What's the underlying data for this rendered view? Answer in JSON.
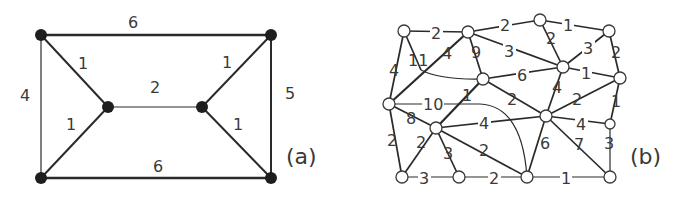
{
  "graph_a": {
    "caption": "(a)",
    "nodes": [
      {
        "id": "TL",
        "x": 41,
        "y": 35
      },
      {
        "id": "TR",
        "x": 271,
        "y": 35
      },
      {
        "id": "BL",
        "x": 41,
        "y": 178
      },
      {
        "id": "BR",
        "x": 271,
        "y": 178
      },
      {
        "id": "ML",
        "x": 108,
        "y": 107
      },
      {
        "id": "MR",
        "x": 202,
        "y": 107
      }
    ],
    "edges": [
      {
        "from": "TL",
        "to": "TR",
        "weight": "6",
        "lx": 133,
        "ly": 23
      },
      {
        "from": "BL",
        "to": "BR",
        "weight": "6",
        "lx": 158,
        "ly": 170
      },
      {
        "from": "TL",
        "to": "BL",
        "weight": "4",
        "lx": 26,
        "ly": 100
      },
      {
        "from": "TR",
        "to": "BR",
        "weight": "5",
        "lx": 291,
        "ly": 97
      },
      {
        "from": "TL",
        "to": "ML",
        "weight": "1",
        "lx": 83,
        "ly": 68
      },
      {
        "from": "BL",
        "to": "ML",
        "weight": "1",
        "lx": 71,
        "ly": 128
      },
      {
        "from": "ML",
        "to": "MR",
        "weight": "2",
        "lx": 155,
        "ly": 92
      },
      {
        "from": "TR",
        "to": "MR",
        "weight": "1",
        "lx": 226,
        "ly": 67
      },
      {
        "from": "BR",
        "to": "MR",
        "weight": "1",
        "lx": 237,
        "ly": 128
      }
    ]
  },
  "graph_b": {
    "caption": "(b)",
    "nodes": [
      {
        "id": "n1",
        "x": 404,
        "y": 31
      },
      {
        "id": "n2",
        "x": 468,
        "y": 32
      },
      {
        "id": "n3",
        "x": 540,
        "y": 20
      },
      {
        "id": "n4",
        "x": 609,
        "y": 31
      },
      {
        "id": "n5",
        "x": 483,
        "y": 79
      },
      {
        "id": "n6",
        "x": 563,
        "y": 67
      },
      {
        "id": "n7",
        "x": 620,
        "y": 78
      },
      {
        "id": "n8",
        "x": 389,
        "y": 104
      },
      {
        "id": "n9",
        "x": 436,
        "y": 128
      },
      {
        "id": "n10",
        "x": 546,
        "y": 116
      },
      {
        "id": "n11",
        "x": 610,
        "y": 124
      },
      {
        "id": "n12",
        "x": 402,
        "y": 177
      },
      {
        "id": "n13",
        "x": 459,
        "y": 177
      },
      {
        "id": "n14",
        "x": 527,
        "y": 177
      },
      {
        "id": "n15",
        "x": 610,
        "y": 177
      }
    ],
    "edges": [
      {
        "from": "n1",
        "to": "n2",
        "weight": "2",
        "lx": 436,
        "ly": 38
      },
      {
        "from": "n2",
        "to": "n3",
        "weight": "2",
        "lx": 505,
        "ly": 30
      },
      {
        "from": "n3",
        "to": "n4",
        "weight": "1",
        "lx": 568,
        "ly": 30
      },
      {
        "from": "n2",
        "to": "n6",
        "weight": "3",
        "lx": 509,
        "ly": 56
      },
      {
        "from": "n3",
        "to": "n6",
        "weight": "2",
        "lx": 551,
        "ly": 43
      },
      {
        "from": "n4",
        "to": "n6",
        "weight": "3",
        "lx": 588,
        "ly": 53
      },
      {
        "from": "n4",
        "to": "n7",
        "weight": "2",
        "lx": 616,
        "ly": 57
      },
      {
        "from": "n6",
        "to": "n7",
        "weight": "1",
        "lx": 586,
        "ly": 78
      },
      {
        "from": "n5",
        "to": "n6",
        "weight": "6",
        "lx": 522,
        "ly": 80
      },
      {
        "from": "n2",
        "to": "n5",
        "weight": "9",
        "lx": 476,
        "ly": 57
      },
      {
        "from": "n1",
        "to": "n8",
        "weight": "4",
        "lx": 394,
        "ly": 75
      },
      {
        "from": "n1",
        "to": "crossing",
        "weight": "11",
        "lx": 414,
        "ly": 65
      },
      {
        "from": "n8",
        "to": "n2",
        "weight": "4",
        "lx": 447,
        "ly": 58
      },
      {
        "from": "n5",
        "to": "n9",
        "weight": "1",
        "lx": 467,
        "ly": 100
      },
      {
        "from": "n5",
        "to": "n10",
        "weight": "2",
        "lx": 512,
        "ly": 104
      },
      {
        "from": "n6",
        "to": "n10",
        "weight": "4",
        "lx": 557,
        "ly": 92
      },
      {
        "from": "n7",
        "to": "n10",
        "weight": "2",
        "lx": 577,
        "ly": 104
      },
      {
        "from": "n7",
        "to": "n11",
        "weight": "1",
        "lx": 616,
        "ly": 106
      },
      {
        "from": "n8",
        "to": "n9",
        "weight": "8",
        "lx": 411,
        "ly": 123
      },
      {
        "from": "n8",
        "to": "n14",
        "weight": "10",
        "lx": 428,
        "ly": 109
      },
      {
        "from": "n9",
        "to": "n10",
        "weight": "4",
        "lx": 484,
        "ly": 128
      },
      {
        "from": "n10",
        "to": "n11",
        "weight": "4",
        "lx": 581,
        "ly": 129
      },
      {
        "from": "n8",
        "to": "n12",
        "weight": "2",
        "lx": 392,
        "ly": 145
      },
      {
        "from": "n9",
        "to": "n12",
        "weight": "2",
        "lx": 421,
        "ly": 147
      },
      {
        "from": "n9",
        "to": "n13",
        "weight": "3",
        "lx": 448,
        "ly": 158
      },
      {
        "from": "n9",
        "to": "n14",
        "weight": "2",
        "lx": 484,
        "ly": 155
      },
      {
        "from": "n10",
        "to": "n14",
        "weight": "6",
        "lx": 545,
        "ly": 148
      },
      {
        "from": "n10",
        "to": "n15",
        "weight": "7",
        "lx": 579,
        "ly": 149
      },
      {
        "from": "n11",
        "to": "n15",
        "weight": "3",
        "lx": 609,
        "ly": 148
      },
      {
        "from": "n12",
        "to": "n13",
        "weight": "3",
        "lx": 424,
        "ly": 183
      },
      {
        "from": "n13",
        "to": "n14",
        "weight": "2",
        "lx": 494,
        "ly": 183
      },
      {
        "from": "n14",
        "to": "n15",
        "weight": "1",
        "lx": 566,
        "ly": 183
      }
    ]
  }
}
